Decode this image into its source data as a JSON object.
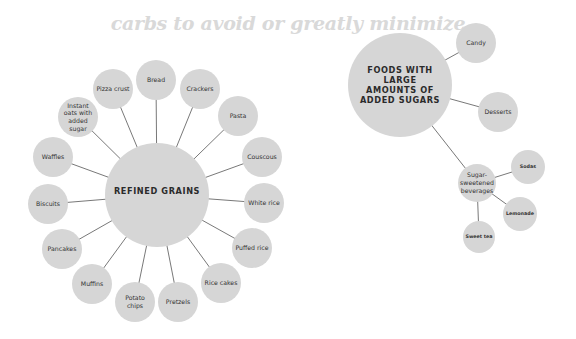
{
  "title": "carbs to avoid or greatly minimize",
  "colors": {
    "node": "#d6d6d6",
    "line": "#555555",
    "title": "#d9d9d9",
    "text": "#333333"
  },
  "refined_grains": {
    "label": "REFINED GRAINS",
    "center": [
      157,
      195
    ],
    "r": 52,
    "items": [
      {
        "label": "Bread",
        "x": 156,
        "y": 80,
        "r": 20
      },
      {
        "label": "Pizza crust",
        "x": 113,
        "y": 89,
        "r": 20
      },
      {
        "label": "Crackers",
        "x": 200,
        "y": 89,
        "r": 20
      },
      {
        "label": "Instant oats with added sugar",
        "x": 78,
        "y": 117,
        "r": 20
      },
      {
        "label": "Pasta",
        "x": 238,
        "y": 116,
        "r": 20
      },
      {
        "label": "Waffles",
        "x": 53,
        "y": 157,
        "r": 20
      },
      {
        "label": "Couscous",
        "x": 262,
        "y": 157,
        "r": 20
      },
      {
        "label": "Biscuits",
        "x": 48,
        "y": 204,
        "r": 20
      },
      {
        "label": "White rice",
        "x": 264,
        "y": 203,
        "r": 20
      },
      {
        "label": "Pancakes",
        "x": 62,
        "y": 249,
        "r": 20
      },
      {
        "label": "Puffed rice",
        "x": 252,
        "y": 248,
        "r": 20
      },
      {
        "label": "Muffins",
        "x": 92,
        "y": 284,
        "r": 20
      },
      {
        "label": "Potato chips",
        "x": 135,
        "y": 302,
        "r": 20
      },
      {
        "label": "Pretzels",
        "x": 178,
        "y": 302,
        "r": 20
      },
      {
        "label": "Rice cakes",
        "x": 221,
        "y": 283,
        "r": 20
      }
    ]
  },
  "added_sugars": {
    "label": "FOODS WITH LARGE AMOUNTS OF ADDED SUGARS",
    "center": [
      400,
      85
    ],
    "r": 52,
    "items": [
      {
        "label": "Candy",
        "x": 476,
        "y": 43,
        "r": 20
      },
      {
        "label": "Desserts",
        "x": 498,
        "y": 112,
        "r": 20
      },
      {
        "label": "Sugar-sweetened beverages",
        "x": 477,
        "y": 183,
        "r": 19,
        "children": [
          {
            "label": "Sodas",
            "x": 528,
            "y": 167,
            "r": 17
          },
          {
            "label": "Lemonade",
            "x": 520,
            "y": 214,
            "r": 17
          },
          {
            "label": "Sweet tea",
            "x": 479,
            "y": 237,
            "r": 16
          }
        ]
      }
    ]
  }
}
